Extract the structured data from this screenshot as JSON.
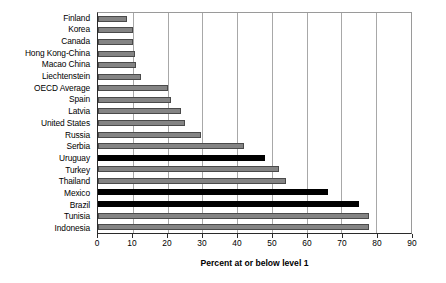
{
  "chart_data": {
    "type": "bar",
    "orientation": "horizontal",
    "title": "",
    "xlabel": "Percent at or below level 1",
    "ylabel": "",
    "xlim": [
      0,
      90
    ],
    "xticks": [
      0,
      10,
      20,
      30,
      40,
      50,
      60,
      70,
      80,
      90
    ],
    "grid": true,
    "legend": false,
    "categories": [
      "Finland",
      "Korea",
      "Canada",
      "Hong Kong-China",
      "Macao China",
      "Liechtenstein",
      "OECD Average",
      "Spain",
      "Latvia",
      "United States",
      "Russia",
      "Serbia",
      "Uruguay",
      "Turkey",
      "Thailand",
      "Mexico",
      "Brazil",
      "Tunisia",
      "Indonesia"
    ],
    "values": [
      8.3,
      10,
      10,
      10.5,
      11,
      12.5,
      20,
      21,
      24,
      25,
      29.5,
      42,
      48,
      52,
      54,
      66,
      75,
      78,
      78
    ],
    "highlighted": [
      "Uruguay",
      "Mexico",
      "Brazil"
    ],
    "colors": {
      "bar_default": "#848484",
      "bar_highlight": "#000000",
      "bar_border": "#4a4a4a",
      "gridline": "#a8a8a8",
      "axis": "#2b2b2b",
      "background": "#ffffff"
    }
  }
}
